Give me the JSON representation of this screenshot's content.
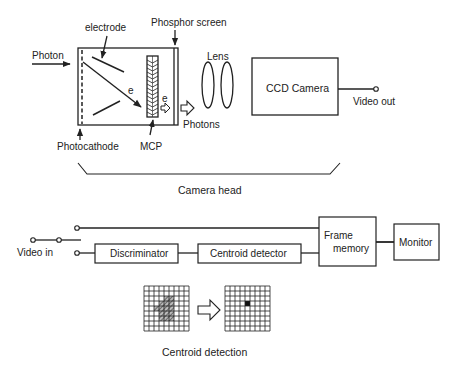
{
  "colors": {
    "ink": "#222222",
    "background": "#ffffff",
    "hatch": "#555555"
  },
  "camera_head": {
    "labels": {
      "electrode": "electrode",
      "phosphor_screen": "Phosphor screen",
      "photon": "Photon",
      "photocathode": "Photocathode",
      "mcp": "MCP",
      "electron_1": "e",
      "electron_2": "e",
      "photons": "Photons",
      "lens": "Lens",
      "ccd_camera": "CCD Camera",
      "video_out": "Video out"
    },
    "bracket_label": "Camera head"
  },
  "processing": {
    "video_in": "Video in",
    "discriminator": "Discriminator",
    "centroid_detector": "Centroid detector",
    "frame_memory_line1": "Frame",
    "frame_memory_line2": "memory",
    "monitor": "Monitor"
  },
  "centroid_detection": {
    "caption": "Centroid detection",
    "grid_size": 9,
    "input_hatched_cells": [
      [
        2,
        4
      ],
      [
        2,
        5
      ],
      [
        3,
        3
      ],
      [
        3,
        4
      ],
      [
        3,
        5
      ],
      [
        4,
        2
      ],
      [
        4,
        3
      ],
      [
        4,
        4
      ],
      [
        4,
        5
      ],
      [
        5,
        3
      ],
      [
        5,
        4
      ],
      [
        5,
        5
      ],
      [
        6,
        3
      ],
      [
        6,
        4
      ],
      [
        6,
        5
      ]
    ],
    "output_centroid_cell": [
      3,
      4
    ]
  }
}
